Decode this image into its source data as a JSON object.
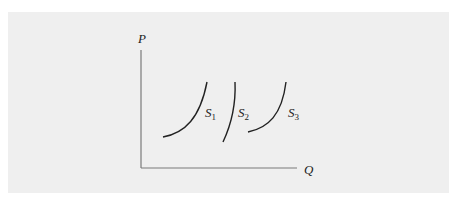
{
  "diagram": {
    "type": "supply-curves",
    "background": "#efefef",
    "axis_color": "#777777",
    "curve_color": "#222222",
    "axes": {
      "y_label": "P",
      "x_label": "Q"
    },
    "curves": [
      {
        "name": "S",
        "subscript": "1"
      },
      {
        "name": "S",
        "subscript": "2"
      },
      {
        "name": "S",
        "subscript": "3"
      }
    ]
  }
}
